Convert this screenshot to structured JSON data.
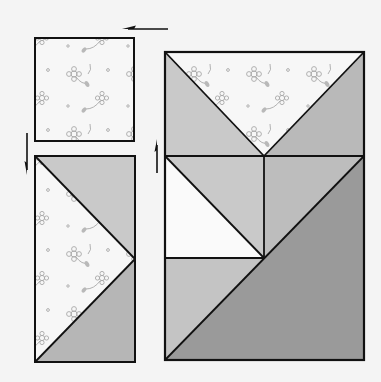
{
  "diagram": {
    "title": "",
    "colors": {
      "background": "#f4f4f4",
      "outline": "#111111",
      "floral_base": "#f7f7f7",
      "floral_motif": "#a8a8a8",
      "light_gray": "#c9c9c9",
      "medium_gray": "#b6b6b6",
      "dark_gray": "#9a9a9a",
      "white": "#fafafa"
    },
    "pieces": {
      "small_square": {
        "label": "floral square",
        "fabric": "floral"
      },
      "rectangle_unit": {
        "label": "half-rectangle unit",
        "fabrics": [
          "floral",
          "light_gray",
          "medium_gray"
        ]
      },
      "assembled_block": {
        "label": "assembled block",
        "fabrics": [
          "floral",
          "light_gray",
          "medium_gray",
          "dark_gray",
          "white"
        ]
      }
    },
    "arrows": [
      {
        "name": "arrow-left",
        "direction": "left"
      },
      {
        "name": "arrow-down",
        "direction": "down"
      },
      {
        "name": "arrow-up",
        "direction": "up"
      }
    ]
  }
}
